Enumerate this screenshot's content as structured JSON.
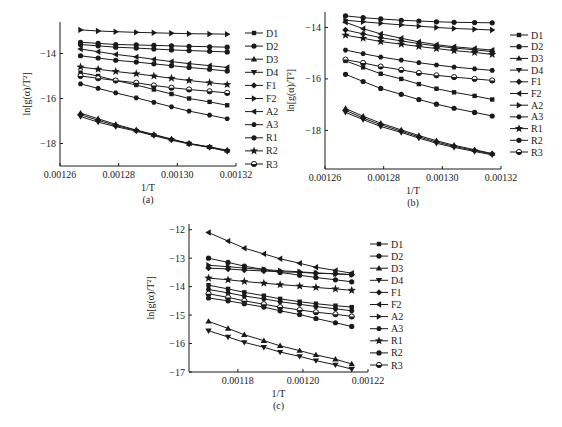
{
  "figure": {
    "style": {
      "ink": "#1a1a1a",
      "background": "#ffffff"
    }
  },
  "chart_data": [
    {
      "id": "a",
      "type": "line",
      "caption": "(a)",
      "xlabel": "1/T",
      "ylabel": "ln[g(α)/T²]",
      "xlim": [
        0.00126,
        0.00132
      ],
      "ylim": [
        -19.0,
        -12.6
      ],
      "xticks": [
        0.00126,
        0.00128,
        0.0013,
        0.00132
      ],
      "xtick_labels": [
        "0.00126",
        "0.00128",
        "0.00130",
        "0.00132"
      ],
      "yticks": [
        -14,
        -16,
        -18
      ],
      "ytick_labels": [
        "-14",
        "-16",
        "-18"
      ],
      "grid": false,
      "legend_position": "right",
      "x": [
        0.001267,
        0.001273,
        0.001279,
        0.001286,
        0.001292,
        0.001298,
        0.001304,
        0.001311,
        0.001317
      ],
      "series": [
        {
          "name": "D1",
          "marker": "square",
          "values": [
            -14.85,
            -15.0,
            -15.2,
            -15.4,
            -15.6,
            -15.8,
            -16.0,
            -16.15,
            -16.3
          ]
        },
        {
          "name": "D2",
          "marker": "circle",
          "values": [
            -13.5,
            -13.55,
            -13.6,
            -13.62,
            -13.64,
            -13.66,
            -13.68,
            -13.7,
            -13.72
          ]
        },
        {
          "name": "D3",
          "marker": "tri-up",
          "values": [
            -16.65,
            -16.9,
            -17.15,
            -17.4,
            -17.6,
            -17.8,
            -18.0,
            -18.15,
            -18.3
          ]
        },
        {
          "name": "D4",
          "marker": "tri-down",
          "values": [
            -16.8,
            -17.05,
            -17.25,
            -17.45,
            -17.65,
            -17.85,
            -18.02,
            -18.18,
            -18.35
          ]
        },
        {
          "name": "F1",
          "marker": "diamond",
          "values": [
            -16.72,
            -16.97,
            -17.2,
            -17.42,
            -17.62,
            -17.82,
            -18.0,
            -18.16,
            -18.32
          ]
        },
        {
          "name": "F2",
          "marker": "tri-right",
          "values": [
            -12.95,
            -13.0,
            -13.03,
            -13.06,
            -13.08,
            -13.1,
            -13.12,
            -13.13,
            -13.14
          ]
        },
        {
          "name": "A2",
          "marker": "tri-left",
          "values": [
            -13.8,
            -13.92,
            -14.04,
            -14.15,
            -14.26,
            -14.36,
            -14.45,
            -14.54,
            -14.62
          ]
        },
        {
          "name": "A3",
          "marker": "hexagon",
          "values": [
            -15.35,
            -15.55,
            -15.75,
            -15.97,
            -16.17,
            -16.37,
            -16.56,
            -16.74,
            -16.9
          ]
        },
        {
          "name": "R1",
          "marker": "circle",
          "values": [
            -14.1,
            -14.2,
            -14.3,
            -14.38,
            -14.46,
            -14.54,
            -14.62,
            -14.7,
            -14.78
          ]
        },
        {
          "name": "R2",
          "marker": "star",
          "values": [
            -14.6,
            -14.7,
            -14.8,
            -14.9,
            -15.0,
            -15.1,
            -15.2,
            -15.3,
            -15.38
          ]
        },
        {
          "name": "R3",
          "marker": "half-circle",
          "values": [
            -15.0,
            -15.1,
            -15.2,
            -15.3,
            -15.42,
            -15.52,
            -15.6,
            -15.68,
            -15.75
          ]
        },
        {
          "name": "D2b",
          "marker": "circle",
          "hidden_in_legend": true,
          "values": [
            -13.6,
            -13.66,
            -13.72,
            -13.76,
            -13.8,
            -13.84,
            -13.87,
            -13.9,
            -13.93
          ]
        }
      ]
    },
    {
      "id": "b",
      "type": "line",
      "caption": "(b)",
      "xlabel": "1/T",
      "ylabel": "ln[g(α)/T²]",
      "xlim": [
        0.00126,
        0.00132
      ],
      "ylim": [
        -19.5,
        -13.4
      ],
      "xticks": [
        0.00126,
        0.00128,
        0.0013,
        0.00132
      ],
      "xtick_labels": [
        "0.00126",
        "0.00128",
        "0.00130",
        "0.00132"
      ],
      "yticks": [
        -14,
        -16,
        -18
      ],
      "ytick_labels": [
        "-14",
        "-16",
        "-18"
      ],
      "grid": false,
      "legend_position": "right",
      "x": [
        0.001267,
        0.001273,
        0.001279,
        0.001286,
        0.001292,
        0.001298,
        0.001304,
        0.001311,
        0.001317
      ],
      "series": [
        {
          "name": "D1",
          "marker": "square",
          "values": [
            -15.3,
            -15.55,
            -15.8,
            -16.0,
            -16.2,
            -16.38,
            -16.52,
            -16.66,
            -16.8
          ]
        },
        {
          "name": "D2",
          "marker": "circle",
          "values": [
            -13.55,
            -13.62,
            -13.67,
            -13.72,
            -13.75,
            -13.78,
            -13.8,
            -13.81,
            -13.82
          ]
        },
        {
          "name": "D3",
          "marker": "tri-up",
          "values": [
            -17.15,
            -17.45,
            -17.72,
            -17.98,
            -18.2,
            -18.4,
            -18.58,
            -18.75,
            -18.9
          ]
        },
        {
          "name": "D4",
          "marker": "tri-down",
          "values": [
            -17.3,
            -17.58,
            -17.85,
            -18.08,
            -18.3,
            -18.5,
            -18.66,
            -18.82,
            -18.95
          ]
        },
        {
          "name": "F1",
          "marker": "diamond",
          "values": [
            -17.22,
            -17.52,
            -17.78,
            -18.03,
            -18.25,
            -18.45,
            -18.62,
            -18.78,
            -18.92
          ]
        },
        {
          "name": "F2",
          "marker": "tri-left",
          "values": [
            -13.8,
            -14.05,
            -14.25,
            -14.42,
            -14.56,
            -14.67,
            -14.75,
            -14.82,
            -14.88
          ]
        },
        {
          "name": "A2",
          "marker": "tri-right",
          "values": [
            -13.72,
            -13.78,
            -13.84,
            -13.9,
            -13.95,
            -14.0,
            -14.04,
            -14.07,
            -14.1
          ]
        },
        {
          "name": "A3",
          "marker": "hexagon",
          "values": [
            -14.88,
            -15.02,
            -15.15,
            -15.27,
            -15.37,
            -15.46,
            -15.54,
            -15.61,
            -15.67
          ]
        },
        {
          "name": "R1",
          "marker": "star",
          "values": [
            -14.3,
            -14.42,
            -14.55,
            -14.65,
            -14.74,
            -14.82,
            -14.9,
            -14.97,
            -15.05
          ]
        },
        {
          "name": "R2",
          "marker": "circle",
          "values": [
            -15.82,
            -16.1,
            -16.37,
            -16.6,
            -16.8,
            -16.98,
            -17.14,
            -17.3,
            -17.44
          ]
        },
        {
          "name": "R3",
          "marker": "half-circle",
          "values": [
            -15.25,
            -15.38,
            -15.52,
            -15.65,
            -15.77,
            -15.86,
            -15.93,
            -16.0,
            -16.06
          ]
        },
        {
          "name": "F1b",
          "marker": "diamond",
          "hidden_in_legend": true,
          "values": [
            -14.1,
            -14.25,
            -14.4,
            -14.52,
            -14.63,
            -14.72,
            -14.8,
            -14.87,
            -14.94
          ]
        }
      ]
    },
    {
      "id": "c",
      "type": "line",
      "caption": "(c)",
      "xlabel": "1/T",
      "ylabel": "ln[g(α)/T²]",
      "xlim": [
        0.001165,
        0.00122
      ],
      "ylim": [
        -17,
        -11.8
      ],
      "xticks": [
        0.00118,
        0.0012,
        0.00122
      ],
      "xtick_labels": [
        "0.00118",
        "0.00120",
        "0.00122"
      ],
      "yticks": [
        -12,
        -13,
        -14,
        -15,
        -16,
        -17
      ],
      "ytick_labels": [
        "-12",
        "-13",
        "-14",
        "-15",
        "-16",
        "-17"
      ],
      "grid": false,
      "legend_position": "right",
      "x": [
        0.001171,
        0.001177,
        0.001182,
        0.001188,
        0.001193,
        0.001199,
        0.001204,
        0.00121,
        0.001215
      ],
      "series": [
        {
          "name": "D1",
          "marker": "square",
          "values": [
            -13.95,
            -14.08,
            -14.2,
            -14.32,
            -14.43,
            -14.53,
            -14.6,
            -14.67,
            -14.72
          ]
        },
        {
          "name": "D2",
          "marker": "circle",
          "values": [
            -13.0,
            -13.15,
            -13.28,
            -13.4,
            -13.5,
            -13.6,
            -13.68,
            -13.76,
            -13.83
          ]
        },
        {
          "name": "D3",
          "marker": "tri-up",
          "values": [
            -15.22,
            -15.47,
            -15.69,
            -15.9,
            -16.08,
            -16.25,
            -16.4,
            -16.55,
            -16.72
          ]
        },
        {
          "name": "D4",
          "marker": "tri-down",
          "values": [
            -15.55,
            -15.77,
            -15.96,
            -16.13,
            -16.3,
            -16.45,
            -16.6,
            -16.75,
            -16.9
          ]
        },
        {
          "name": "F1",
          "marker": "diamond",
          "values": [
            -13.35,
            -13.38,
            -13.42,
            -13.45,
            -13.48,
            -13.5,
            -13.53,
            -13.55,
            -13.58
          ]
        },
        {
          "name": "F2",
          "marker": "tri-left",
          "values": [
            -12.1,
            -12.4,
            -12.65,
            -12.85,
            -13.02,
            -13.18,
            -13.32,
            -13.43,
            -13.53
          ]
        },
        {
          "name": "A2",
          "marker": "tri-right",
          "values": [
            -13.25,
            -13.3,
            -13.35,
            -13.4,
            -13.44,
            -13.48,
            -13.52,
            -13.55,
            -13.58
          ]
        },
        {
          "name": "A3",
          "marker": "hexagon",
          "values": [
            -14.1,
            -14.22,
            -14.33,
            -14.43,
            -14.53,
            -14.62,
            -14.7,
            -14.78,
            -14.85
          ]
        },
        {
          "name": "R1",
          "marker": "star",
          "values": [
            -13.7,
            -13.76,
            -13.82,
            -13.88,
            -13.93,
            -13.98,
            -14.03,
            -14.08,
            -14.13
          ]
        },
        {
          "name": "R2",
          "marker": "circle",
          "values": [
            -14.4,
            -14.5,
            -14.6,
            -14.72,
            -14.85,
            -14.98,
            -15.12,
            -15.27,
            -15.4
          ]
        },
        {
          "name": "R3",
          "marker": "half-circle",
          "values": [
            -14.25,
            -14.38,
            -14.5,
            -14.62,
            -14.72,
            -14.82,
            -14.9,
            -14.97,
            -15.05
          ]
        }
      ]
    }
  ]
}
